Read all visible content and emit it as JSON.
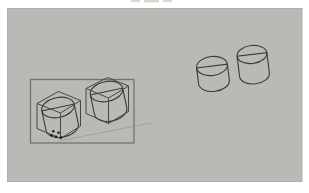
{
  "figure": {
    "type": "3d-modeling-viewport",
    "selected_cylinder_count": 2,
    "copy_cylinder_count": 2,
    "cursor_tool": "move-copy"
  },
  "colors": {
    "page_bg": "#ffffff",
    "canvas_bg": "#b9b9b6",
    "canvas_edge": "#adadaa",
    "outline": "#3b3b38",
    "cylinder_top": "#f2f2ed",
    "selection_rect": "#73736e",
    "wireframe": "#46464b",
    "inference_line": "#9c9c96",
    "cursor": "#161616",
    "caption_remnant": "#d6d6d4"
  }
}
